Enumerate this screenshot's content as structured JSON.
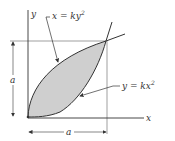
{
  "figure": {
    "axes": {
      "x_label": "x",
      "y_label": "y"
    },
    "curves": [
      {
        "id": "upper",
        "equation_lhs": "x = ky",
        "exponent": "2"
      },
      {
        "id": "lower",
        "equation_lhs": "y = kx",
        "exponent": "2"
      }
    ],
    "dimensions": {
      "vertical": "a",
      "horizontal": "a"
    },
    "colors": {
      "region_fill": "#cfcfcf",
      "line": "#333333",
      "thin_line": "#777777"
    }
  }
}
